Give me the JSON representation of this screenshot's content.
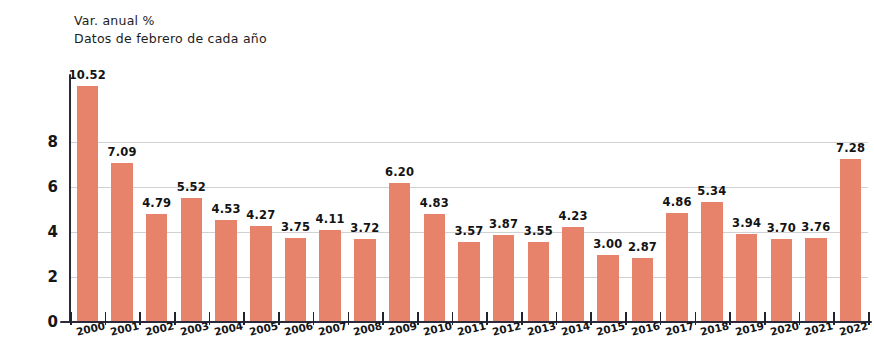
{
  "header": {
    "title_line1": "Var. anual %",
    "title_line2": "Datos de febrero de cada año"
  },
  "colors": {
    "bar": "#e8836b",
    "axis": "#2b2b3c",
    "gridline": "#c9c9cd",
    "text": "#161616",
    "background": "#ffffff"
  },
  "chart_data": {
    "type": "bar",
    "title": "Var. anual %",
    "subtitle": "Datos de febrero de cada año",
    "xlabel": "",
    "ylabel": "",
    "ylim": [
      0,
      11
    ],
    "yticks": [
      "0",
      "2",
      "4",
      "6",
      "8"
    ],
    "ytick_values": [
      0,
      2,
      4,
      6,
      8
    ],
    "grid": true,
    "legend": false,
    "categories": [
      "2000",
      "2001",
      "2002",
      "2003",
      "2004",
      "2005",
      "2006",
      "2007",
      "2008",
      "2009",
      "2010",
      "2011",
      "2012",
      "2013",
      "2014",
      "2015",
      "2016",
      "2017",
      "2018",
      "2019",
      "2020",
      "2021",
      "2022"
    ],
    "values": [
      10.52,
      7.09,
      4.79,
      5.52,
      4.53,
      4.27,
      3.75,
      4.11,
      3.72,
      6.2,
      4.83,
      3.57,
      3.87,
      3.55,
      4.23,
      3.0,
      2.87,
      4.86,
      5.34,
      3.94,
      3.7,
      3.76,
      7.28
    ],
    "value_labels": [
      "10.52",
      "7.09",
      "4.79",
      "5.52",
      "4.53",
      "4.27",
      "3.75",
      "4.11",
      "3.72",
      "6.20",
      "4.83",
      "3.57",
      "3.87",
      "3.55",
      "4.23",
      "3.00",
      "2.87",
      "4.86",
      "5.34",
      "3.94",
      "3.70",
      "3.76",
      "7.28"
    ]
  }
}
